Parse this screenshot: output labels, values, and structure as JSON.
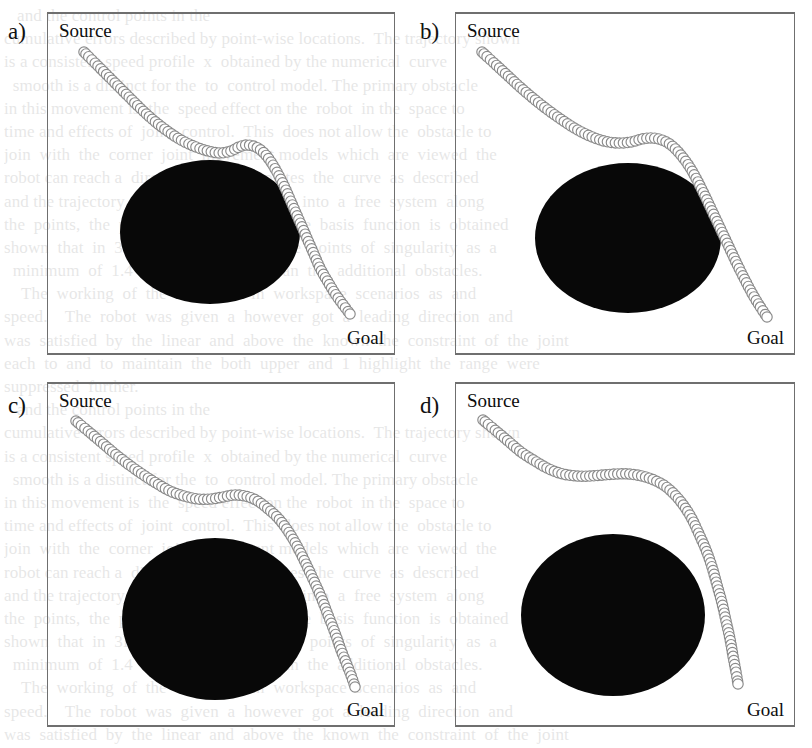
{
  "figure": {
    "background_color": "#ffffff",
    "obstacle_color": "#080808",
    "trajectory_stroke_color": "#8a8a8a",
    "box_border_color": "#6f6f6f",
    "marker_label": "trajectory-circle-marker",
    "ghost_text_lines": [
      "   and the control points in the",
      "cumulative errors described by point-wise locations.  The trajectory shown",
      "is a consistent speed profile  x  obtained by the numerical  curve",
      "  smooth is a distinct for the  to  control model. The primary obstacle",
      "in this movement is  the  speed effect on the  robot  in the  space to",
      "time and effects of  joint  control.  This  does not allow the  obstacle to",
      "join  with  the  corner  joint  movement models  which  are  viewed  the  ",
      "robot can reach a  direction  and  completes  the  curve  as  described",
      "and the trajectory  that  was  then  derived  into  a  free  system  along",
      "the  points,  the  polynomials  that  the  ,  the  basis  function  is  obtained",
      "shown  that  in  3D  is  computed  with  the  points  of  singularity  as  a  ",
      "  minimum  of  1.4  which  is  greater  than  the  additional  obstacles.",
      "    The  working  of  the  algorithm  in  workspace  scenarios  as  and",
      "speed.    The  robot  was  given  a  however  got  a  leading  direction  and",
      "was  satisfied  by  the  linear  and  above  the  known  the  constraint  of  the  joint",
      "each  to  and  to  maintain  the  both  upper  and  1  highlight  the  range  were",
      "suppressed  further."
    ],
    "panels": [
      {
        "tag": "a)",
        "source_label": "Source",
        "goal_label": "Goal",
        "obstacle": {
          "cx": 162,
          "cy": 218,
          "rx": 90,
          "ry": 72
        },
        "trajectory": {
          "marker_radius": 5.2,
          "step": 4.0,
          "points": [
            [
              36,
              38
            ],
            [
              48,
              50
            ],
            [
              62,
              64
            ],
            [
              76,
              78
            ],
            [
              90,
              92
            ],
            [
              104,
              105
            ],
            [
              118,
              116
            ],
            [
              133,
              126
            ],
            [
              148,
              133
            ],
            [
              160,
              137
            ],
            [
              172,
              139
            ],
            [
              183,
              137
            ],
            [
              191,
              133
            ],
            [
              199,
              131
            ],
            [
              208,
              133
            ],
            [
              216,
              139
            ],
            [
              223,
              148
            ],
            [
              230,
              160
            ],
            [
              237,
              174
            ],
            [
              244,
              190
            ],
            [
              251,
              206
            ],
            [
              258,
              222
            ],
            [
              265,
              238
            ],
            [
              272,
              254
            ],
            [
              280,
              268
            ],
            [
              288,
              281
            ],
            [
              296,
              292
            ],
            [
              302,
              300
            ]
          ]
        }
      },
      {
        "tag": "b)",
        "source_label": "Source",
        "goal_label": "Goal",
        "obstacle": {
          "cx": 172,
          "cy": 224,
          "rx": 93,
          "ry": 75
        },
        "trajectory": {
          "marker_radius": 5.2,
          "step": 4.0,
          "points": [
            [
              26,
              38
            ],
            [
              38,
              49
            ],
            [
              51,
              61
            ],
            [
              64,
              73
            ],
            [
              78,
              85
            ],
            [
              92,
              96
            ],
            [
              106,
              106
            ],
            [
              120,
              115
            ],
            [
              134,
              122
            ],
            [
              148,
              127
            ],
            [
              162,
              129
            ],
            [
              175,
              128
            ],
            [
              186,
              125
            ],
            [
              196,
              124
            ],
            [
              206,
              126
            ],
            [
              215,
              131
            ],
            [
              224,
              140
            ],
            [
              233,
              152
            ],
            [
              241,
              166
            ],
            [
              249,
              182
            ],
            [
              257,
              199
            ],
            [
              265,
              216
            ],
            [
              273,
              233
            ],
            [
              281,
              250
            ],
            [
              289,
              266
            ],
            [
              297,
              281
            ],
            [
              305,
              294
            ],
            [
              311,
              303
            ]
          ]
        }
      },
      {
        "tag": "c)",
        "source_label": "Source",
        "goal_label": "Goal",
        "obstacle": {
          "cx": 167,
          "cy": 235,
          "rx": 93,
          "ry": 81
        },
        "trajectory": {
          "marker_radius": 5.2,
          "step": 4.0,
          "points": [
            [
              28,
              37
            ],
            [
              40,
              47
            ],
            [
              53,
              58
            ],
            [
              66,
              69
            ],
            [
              80,
              80
            ],
            [
              94,
              90
            ],
            [
              108,
              99
            ],
            [
              122,
              107
            ],
            [
              136,
              112
            ],
            [
              150,
              115
            ],
            [
              163,
              115
            ],
            [
              175,
              113
            ],
            [
              186,
              111
            ],
            [
              197,
              112
            ],
            [
              208,
              116
            ],
            [
              219,
              124
            ],
            [
              230,
              134
            ],
            [
              240,
              147
            ],
            [
              249,
              162
            ],
            [
              257,
              178
            ],
            [
              265,
              195
            ],
            [
              273,
              213
            ],
            [
              280,
              231
            ],
            [
              287,
              249
            ],
            [
              293,
              266
            ],
            [
              299,
              281
            ],
            [
              304,
              294
            ],
            [
              307,
              303
            ]
          ]
        }
      },
      {
        "tag": "d)",
        "source_label": "Source",
        "goal_label": "Goal",
        "obstacle": {
          "cx": 157,
          "cy": 231,
          "rx": 92,
          "ry": 81
        },
        "trajectory": {
          "marker_radius": 5.2,
          "step": 4.0,
          "points": [
            [
              27,
              36
            ],
            [
              39,
              46
            ],
            [
              52,
              57
            ],
            [
              65,
              68
            ],
            [
              79,
              77
            ],
            [
              93,
              85
            ],
            [
              107,
              90
            ],
            [
              121,
              92
            ],
            [
              134,
              92
            ],
            [
              147,
              91
            ],
            [
              160,
              90
            ],
            [
              173,
              90
            ],
            [
              186,
              92
            ],
            [
              198,
              96
            ],
            [
              209,
              102
            ],
            [
              219,
              111
            ],
            [
              228,
              122
            ],
            [
              236,
              135
            ],
            [
              243,
              150
            ],
            [
              250,
              166
            ],
            [
              256,
              183
            ],
            [
              261,
              201
            ],
            [
              266,
              219
            ],
            [
              270,
              237
            ],
            [
              274,
              255
            ],
            [
              277,
              272
            ],
            [
              280,
              288
            ],
            [
              282,
              300
            ]
          ]
        }
      }
    ]
  }
}
